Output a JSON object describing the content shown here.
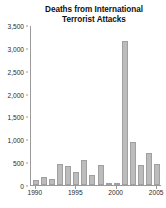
{
  "chart_data": {
    "type": "bar",
    "title": "Deaths from International Terrorist Attacks",
    "title_lines": [
      "Deaths from International",
      "Terrorist Attacks"
    ],
    "xlabel": "",
    "ylabel": "",
    "categories": [
      1990,
      1991,
      1992,
      1993,
      1994,
      1995,
      1996,
      1997,
      1998,
      1999,
      2000,
      2001,
      2002,
      2003,
      2004,
      2005
    ],
    "values": [
      110,
      180,
      135,
      455,
      425,
      285,
      545,
      230,
      435,
      25,
      35,
      3150,
      950,
      440,
      705,
      470
    ],
    "series": [
      {
        "name": "Deaths",
        "values": [
          110,
          180,
          135,
          455,
          425,
          285,
          545,
          230,
          435,
          25,
          35,
          3150,
          950,
          440,
          705,
          470
        ]
      }
    ],
    "ylim": [
      0,
      3500
    ],
    "xlim": [
      1989.4,
      2005.6
    ],
    "y_ticks": [
      0,
      500,
      1000,
      1500,
      2000,
      2500,
      3000,
      3500
    ],
    "y_tick_labels": [
      "0",
      "500",
      "1,000",
      "1,500",
      "2,000",
      "2,500",
      "3,000",
      "3,500"
    ],
    "x_ticks": [
      1990,
      1995,
      2000,
      2005
    ],
    "x_tick_labels": [
      "1990",
      "1995",
      "2000",
      "2005"
    ],
    "grid": false,
    "legend": false,
    "legend_position": "none",
    "bar_color": "#bcbcbc",
    "bar_edge_color": "#a0a0a0",
    "axis_color": "#9b9b9b",
    "background_color": "#ffffff",
    "text_color": "#1a1a1a"
  }
}
